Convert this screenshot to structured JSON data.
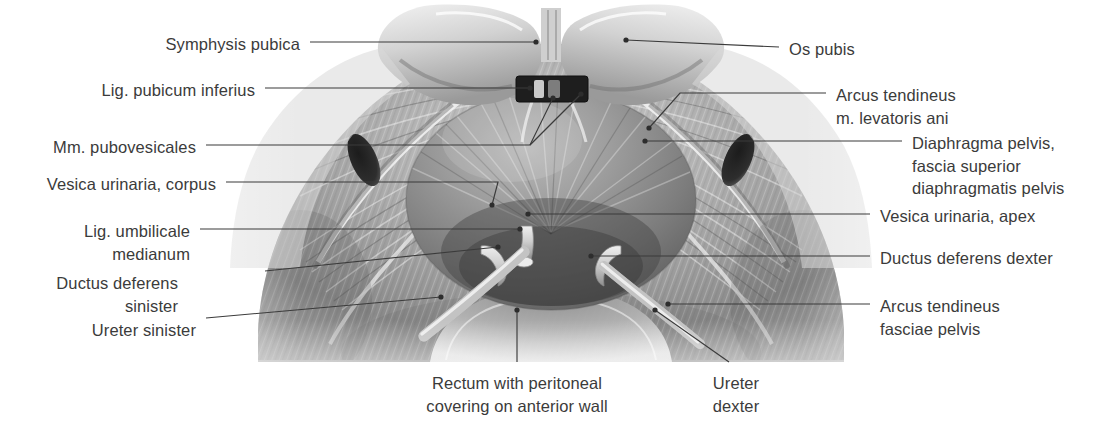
{
  "figure": {
    "type": "anatomical-illustration",
    "style": "grayscale halftone drawing",
    "text_color": "#3b3b3b",
    "leader_color": "#3b3b3b",
    "background": "#ffffff"
  },
  "labels_left": [
    {
      "id": "symphysis-pubica",
      "text": "Symphysis pubica",
      "x": 300,
      "y": 33,
      "align": "right"
    },
    {
      "id": "lig-pubicum-inferius",
      "text": "Lig. pubicum inferius",
      "x": 255,
      "y": 79,
      "align": "right"
    },
    {
      "id": "mm-pubovesicales",
      "text": "Mm. pubovesicales",
      "x": 196,
      "y": 136,
      "align": "right"
    },
    {
      "id": "vesica-urinaria-corpus",
      "text": "Vesica urinaria, corpus",
      "x": 216,
      "y": 173,
      "align": "right"
    },
    {
      "id": "lig-umbilicale-medianum",
      "text": "Lig. umbilicale\nmedianum",
      "x": 190,
      "y": 220,
      "align": "right"
    },
    {
      "id": "ductus-deferens-sinister",
      "text": "Ductus deferens\nsinister",
      "x": 178,
      "y": 272,
      "align": "right"
    },
    {
      "id": "ureter-sinister",
      "text": "Ureter sinister",
      "x": 196,
      "y": 319,
      "align": "right"
    }
  ],
  "labels_right": [
    {
      "id": "os-pubis",
      "text": "Os pubis",
      "x": 789,
      "y": 38,
      "align": "left"
    },
    {
      "id": "arcus-tendineus-m-levatoris-ani",
      "text": "Arcus tendineus\nm. levatoris ani",
      "x": 836,
      "y": 84,
      "align": "left"
    },
    {
      "id": "diaphragma-pelvis",
      "text": "Diaphragma pelvis,\nfascia superior\ndiaphragmatis pelvis",
      "x": 912,
      "y": 132,
      "align": "left"
    },
    {
      "id": "vesica-urinaria-apex",
      "text": "Vesica urinaria, apex",
      "x": 880,
      "y": 205,
      "align": "left"
    },
    {
      "id": "ductus-deferens-dexter",
      "text": "Ductus deferens dexter",
      "x": 880,
      "y": 247,
      "align": "left"
    },
    {
      "id": "arcus-tendineus-fasciae-pelvis",
      "text": "Arcus tendineus\nfasciae pelvis",
      "x": 880,
      "y": 295,
      "align": "left"
    }
  ],
  "labels_bottom": [
    {
      "id": "rectum-with-peritoneal-covering",
      "text": "Rectum with peritoneal\ncovering on anterior wall",
      "x": 517,
      "y": 372,
      "align": "center"
    },
    {
      "id": "ureter-dexter",
      "text": "Ureter\ndexter",
      "x": 736,
      "y": 372,
      "align": "center"
    }
  ],
  "leaders": [
    {
      "id": "leader-symphysis-pubica",
      "points": "310,42 536,42",
      "dot": "536,42"
    },
    {
      "id": "leader-lig-pubicum-inferius",
      "points": "265,88 530,88",
      "dot": "530,88"
    },
    {
      "id": "leader-mm-pubovesicales",
      "points": "206,145 530,145 553,98",
      "dot": "553,98",
      "fork": "530,145 581,94",
      "fork_dot": "581,94"
    },
    {
      "id": "leader-vesica-urinaria-corpus",
      "points": "226,182 498,182 492,205",
      "dot": "492,205"
    },
    {
      "id": "leader-lig-umbilicale-medianum",
      "points": "200,229 520,229",
      "dot": "520,229"
    },
    {
      "id": "leader-ductus-deferens-sinister",
      "points": "265,271 498,247",
      "dot": "498,247"
    },
    {
      "id": "leader-ureter-sinister",
      "points": "206,318 441,297",
      "dot": "441,297"
    },
    {
      "id": "leader-os-pubis",
      "points": "779,47 626,40",
      "dot": "626,40"
    },
    {
      "id": "leader-arcus-tendineus-m-levatoris-ani",
      "points": "826,93 680,93 649,128",
      "dot": "649,128"
    },
    {
      "id": "leader-diaphragma-pelvis",
      "points": "902,141 645,141",
      "dot": "645,141"
    },
    {
      "id": "leader-vesica-urinaria-apex",
      "points": "870,214 528,214",
      "dot": "528,214"
    },
    {
      "id": "leader-ductus-deferens-dexter",
      "points": "870,256 591,256",
      "dot": "591,256"
    },
    {
      "id": "leader-arcus-tendineus-fasciae-pelvis",
      "points": "870,304 668,304",
      "dot": "668,304"
    },
    {
      "id": "leader-rectum",
      "points": "517,362 517,310",
      "dot": "517,310"
    },
    {
      "id": "leader-ureter-dexter",
      "points": "729,362 655,310",
      "dot": "655,310"
    }
  ],
  "anatomy_regions": [
    {
      "id": "os-pubis-left",
      "note": "left pubic bone, pale rounded mass, upper left of midline"
    },
    {
      "id": "os-pubis-right",
      "note": "right pubic bone, pale rounded mass, upper right of midline"
    },
    {
      "id": "symphysis-pubica",
      "note": "midline notch between the pubic bones at top center"
    },
    {
      "id": "lig-pubicum-inferius",
      "note": "dark band beneath the symphysis at midline"
    },
    {
      "id": "foramen-obturatum-left",
      "note": "dark elongated ellipse, left lateral fascia"
    },
    {
      "id": "foramen-obturatum-right",
      "note": "dark elongated ellipse, right lateral fascia"
    },
    {
      "id": "vesica-urinaria",
      "note": "large central dome of the urinary bladder with radiating striations"
    },
    {
      "id": "ductus-deferens-left-stump",
      "note": "pale tubular stump left of bladder apex"
    },
    {
      "id": "ductus-deferens-right-stump",
      "note": "pale tubular stump right of bladder apex"
    },
    {
      "id": "ureter-left",
      "note": "pale tube running down-left from bladder base"
    },
    {
      "id": "ureter-right",
      "note": "pale tube running down-right from bladder base"
    },
    {
      "id": "rectum",
      "note": "rounded shaded mass below the bladder at bottom center"
    },
    {
      "id": "diaphragma-pelvis",
      "note": "fan of striated fascia spreading laterally from midline"
    }
  ]
}
